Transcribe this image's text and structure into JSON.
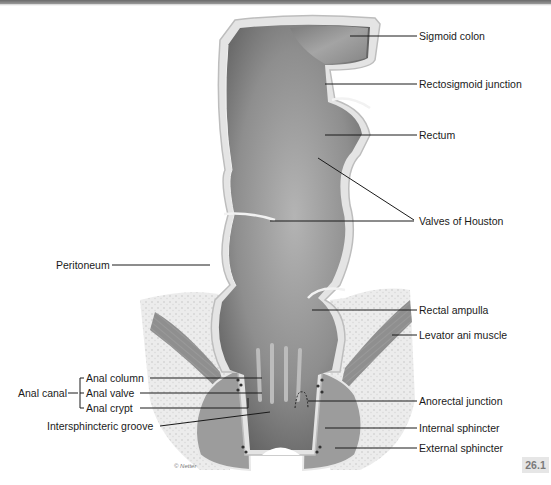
{
  "figure": {
    "number": "26.1",
    "copyright": "© Netter"
  },
  "labels_right": {
    "sigmoid_colon": "Sigmoid colon",
    "rectosigmoid_junction": "Rectosigmoid junction",
    "rectum": "Rectum",
    "valves_of_houston": "Valves of Houston",
    "rectal_ampulla": "Rectal ampulla",
    "levator_ani_muscle": "Levator ani muscle",
    "anorectal_junction": "Anorectal junction",
    "internal_sphincter": "Internal sphincter",
    "external_sphincter": "External sphincter"
  },
  "labels_left": {
    "peritoneum": "Peritoneum",
    "anal_canal": "Anal canal",
    "anal_column": "Anal column",
    "anal_valve": "Anal valve",
    "anal_crypt": "Anal crypt",
    "intersphincteric_groove": "Intersphincteric groove"
  },
  "colors": {
    "lumen_dark": "#6e6e6e",
    "lumen_mid": "#9a9a9a",
    "wall_light": "#d9d9d9",
    "fat_tissue": "#e9e9e9",
    "muscle": "#8c8c8c",
    "leader_line": "#1a1a1a",
    "badge_bg": "#e6e6e6",
    "badge_text": "#7a7a7a"
  }
}
